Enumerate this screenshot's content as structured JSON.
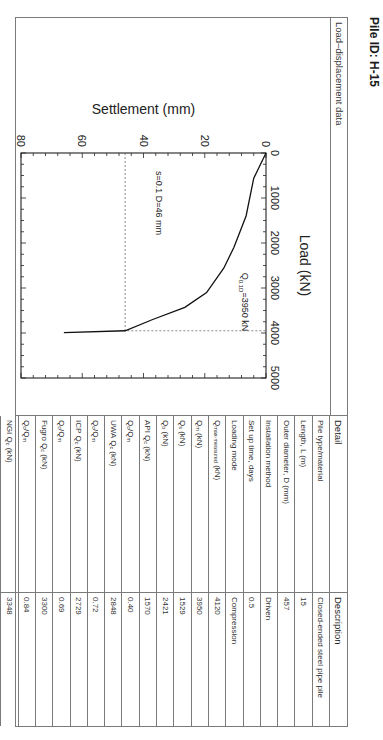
{
  "page": {
    "title": "Pile ID: H-15"
  },
  "left_panel": {
    "header": "Load–displacement data"
  },
  "table": {
    "headers": {
      "detail": "Detail",
      "description": "Description"
    },
    "rows": [
      {
        "detail": "Pile type/material",
        "value": "Closed-ended steel pipe pile"
      },
      {
        "detail": "Length, L (m)",
        "value": "15"
      },
      {
        "detail": "Outer diameter, D (mm)",
        "value": "457"
      },
      {
        "detail": "Installation method",
        "value": "Driven"
      },
      {
        "detail": "Set up time, days",
        "value": "0.5"
      },
      {
        "detail": "Loading mode",
        "value": "Compression"
      },
      {
        "detail": "Qmax-measured (kN)",
        "value": "4120"
      },
      {
        "detail": "Qm (kN)",
        "value": "3950"
      },
      {
        "detail": "Qs (kN)",
        "value": "1529"
      },
      {
        "detail": "Qb (kN)",
        "value": "2421"
      },
      {
        "detail": "API Qc (kN)",
        "value": "1570"
      },
      {
        "detail": "Qc/Qm",
        "value": "0.40"
      },
      {
        "detail": "UWA Qc (kN)",
        "value": "2848"
      },
      {
        "detail": "Qc/Qm",
        "value": "0.72"
      },
      {
        "detail": "ICP Qc (kN)",
        "value": "2729"
      },
      {
        "detail": "Qc/Qm",
        "value": "0.69"
      },
      {
        "detail": "Fugro Qc (kN)",
        "value": "3300"
      },
      {
        "detail": "Qc/Qm",
        "value": "0.84"
      },
      {
        "detail": "NGI Qc (kN)",
        "value": "3348"
      },
      {
        "detail": "Qc/Qm",
        "value": "0.85"
      }
    ]
  },
  "chart_data": {
    "type": "line",
    "title": "",
    "xlabel": "Load (kN)",
    "ylabel": "Settlement (mm)",
    "xlim": [
      0,
      5000
    ],
    "ylim": [
      0,
      80
    ],
    "y_inverted": true,
    "x_axis_position": "top",
    "x_ticks": [
      "0",
      "1000",
      "2000",
      "3000",
      "4000",
      "5000"
    ],
    "y_ticks": [
      "0",
      "20",
      "40",
      "60",
      "80"
    ],
    "grid": false,
    "series": [
      {
        "name": "Load-settlement curve",
        "x": [
          0,
          560,
          1400,
          2100,
          2560,
          3100,
          3430,
          3700,
          3950,
          3990
        ],
        "y": [
          0,
          4,
          6.5,
          10.5,
          13.8,
          19.4,
          26.5,
          37,
          46,
          66
        ]
      }
    ],
    "annotations": [
      {
        "text": "s=0.1 D=46 mm",
        "type": "dashed-horizontal",
        "y": 46
      },
      {
        "text": "Q0.1D=3950 kN",
        "type": "dashed-vertical",
        "x": 3950
      }
    ],
    "labels": {
      "xlabel": "Load (kN)",
      "ylabel": "Settlement (mm)",
      "s_annot": "s=0.1 D=46 mm",
      "q_annot_main": "Q",
      "q_annot_sub": "0.1D",
      "q_annot_rest": "=3950 kN"
    }
  }
}
